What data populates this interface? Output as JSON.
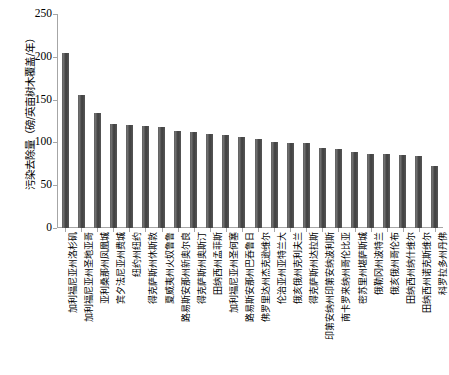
{
  "chart_data": {
    "type": "bar",
    "title": "",
    "xlabel": "",
    "ylabel": "污染去除量（磅/英亩树木覆盖/年）",
    "ylim": [
      0,
      250
    ],
    "yticks": [
      0,
      50,
      100,
      150,
      200,
      250
    ],
    "ytick_labels": [
      "0",
      "50",
      "100",
      "150",
      "200",
      "250"
    ],
    "grid": false,
    "legend": "none",
    "bar_color": "#4a4a4a",
    "categories": [
      "加利福尼亚州洛杉矶",
      "加利福尼亚州圣地亚哥",
      "亚利桑那州凤凰城",
      "宾夕法尼亚州费城",
      "纽约州纽约",
      "得克萨斯州休斯敦",
      "夏威夷州火奴鲁鲁",
      "路易斯安那州新奥尔良",
      "得克萨斯州奥斯汀",
      "田纳西州孟菲斯",
      "加利福尼亚州圣何塞",
      "路易斯安那州巴吞鲁日",
      "佛罗里达州杰克逊维尔",
      "伦治亚州亚特兰大",
      "俄亥俄州克利夫兰",
      "得克萨斯州达拉斯",
      "印第安纳州印第安纳波利斯",
      "南卡罗来纳州哥伦比亚",
      "密苏里州堪萨斯城",
      "俄勒冈州波特兰",
      "俄亥俄州哥伦布",
      "田纳西州纳什维尔",
      "田纳西州诺克斯维尔",
      "科罗拉多州丹佛"
    ],
    "values": [
      205,
      155,
      134,
      122,
      120,
      119,
      118,
      113,
      112,
      110,
      109,
      106,
      104,
      101,
      99,
      99,
      94,
      92,
      89,
      87,
      86,
      85,
      84,
      72
    ]
  }
}
